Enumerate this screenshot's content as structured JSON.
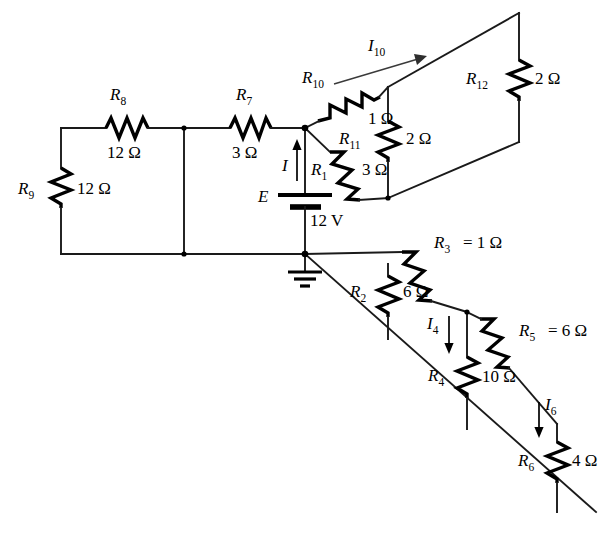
{
  "diagram": {
    "source_label": "E",
    "source_value": "12 V",
    "ohm_symbol": "Ω",
    "equals": "=",
    "components": [
      {
        "id": "R1",
        "name": "R",
        "sub": "1",
        "value": "3",
        "unit": "Ω",
        "show_equals": false,
        "orientation": "diagonal-down-right"
      },
      {
        "id": "R2",
        "name": "R",
        "sub": "2",
        "value": "6",
        "unit": "Ω",
        "show_equals": false,
        "orientation": "vertical"
      },
      {
        "id": "R3",
        "name": "R",
        "sub": "3",
        "value": "1",
        "unit": "Ω",
        "show_equals": true,
        "orientation": "diagonal-down-right"
      },
      {
        "id": "R4",
        "name": "R",
        "sub": "4",
        "value": "10",
        "unit": "Ω",
        "show_equals": false,
        "orientation": "vertical"
      },
      {
        "id": "R5",
        "name": "R",
        "sub": "5",
        "value": "6",
        "unit": "Ω",
        "show_equals": true,
        "orientation": "diagonal-down-right"
      },
      {
        "id": "R6",
        "name": "R",
        "sub": "6",
        "value": "4",
        "unit": "Ω",
        "show_equals": false,
        "orientation": "vertical"
      },
      {
        "id": "R7",
        "name": "R",
        "sub": "7",
        "value": "3",
        "unit": "Ω",
        "show_equals": false,
        "orientation": "horizontal"
      },
      {
        "id": "R8",
        "name": "R",
        "sub": "8",
        "value": "12",
        "unit": "Ω",
        "show_equals": false,
        "orientation": "horizontal"
      },
      {
        "id": "R9",
        "name": "R",
        "sub": "9",
        "value": "12",
        "unit": "Ω",
        "show_equals": false,
        "orientation": "vertical"
      },
      {
        "id": "R10",
        "name": "R",
        "sub": "10",
        "value": "1",
        "unit": "Ω",
        "show_equals": false,
        "orientation": "diagonal-up-right"
      },
      {
        "id": "R11",
        "name": "R",
        "sub": "11",
        "value": "2",
        "unit": "Ω",
        "show_equals": false,
        "orientation": "vertical"
      },
      {
        "id": "R12",
        "name": "R",
        "sub": "12",
        "value": "2",
        "unit": "Ω",
        "show_equals": false,
        "orientation": "vertical"
      }
    ],
    "currents": [
      {
        "id": "I",
        "name": "I",
        "sub": "",
        "direction": "up"
      },
      {
        "id": "I4",
        "name": "I",
        "sub": "4",
        "direction": "down"
      },
      {
        "id": "I6",
        "name": "I",
        "sub": "6",
        "direction": "down"
      },
      {
        "id": "I10",
        "name": "I",
        "sub": "10",
        "direction": "up-right"
      }
    ],
    "labels": {
      "R1_name": "R",
      "R1_sub": "1",
      "R1_val": "3 Ω",
      "R2_name": "R",
      "R2_sub": "2",
      "R2_val": "6 Ω",
      "R3_name": "R",
      "R3_sub": "3",
      "R3_val": "=  1 Ω",
      "R4_name": "R",
      "R4_sub": "4",
      "R4_val": "10 Ω",
      "R5_name": "R",
      "R5_sub": "5",
      "R5_val": "=  6 Ω",
      "R6_name": "R",
      "R6_sub": "6",
      "R6_val": "4 Ω",
      "R7_name": "R",
      "R7_sub": "7",
      "R7_val": "3 Ω",
      "R8_name": "R",
      "R8_sub": "8",
      "R8_val": "12 Ω",
      "R9_name": "R",
      "R9_sub": "9",
      "R9_val": "12 Ω",
      "R10_name": "R",
      "R10_sub": "10",
      "R10_val": "1 Ω",
      "R11_name": "R",
      "R11_sub": "11",
      "R11_val": "2 Ω",
      "R12_name": "R",
      "R12_sub": "12",
      "R12_val": "2 Ω",
      "E_name": "E",
      "E_val": "12 V",
      "I_name": "I",
      "I_sub": "",
      "I4_name": "I",
      "I4_sub": "4",
      "I6_name": "I",
      "I6_sub": "6",
      "I10_name": "I",
      "I10_sub": "10"
    },
    "colors": {
      "wire": "#1a1a1a",
      "resistor": "#000000",
      "text": "#000000",
      "background": "#ffffff"
    },
    "nodes": {
      "ground_label": "ground",
      "top_junction": "top-node",
      "ground_junction": "ground-node"
    }
  }
}
